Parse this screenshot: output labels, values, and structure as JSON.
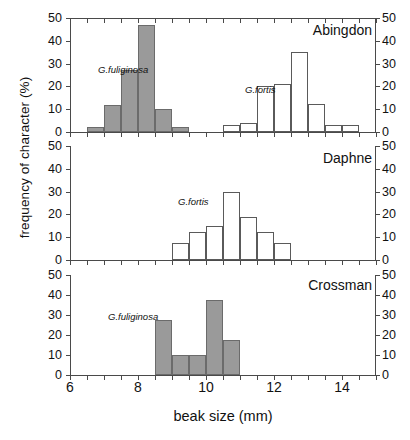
{
  "chart_data": {
    "type": "bar",
    "title": "",
    "xlabel": "beak size (mm)",
    "ylabel": "frequency of character (%)",
    "xlim": [
      6,
      15
    ],
    "ylim": [
      0,
      50
    ],
    "x_ticks_major": [
      6,
      8,
      10,
      12,
      14
    ],
    "x_tick_minor_step": 0.5,
    "y_ticks": [
      0,
      10,
      20,
      30,
      40,
      50
    ],
    "bin_width": 0.5,
    "grid": false,
    "legend": "inline-annotations",
    "panels": [
      {
        "name": "Abingdon",
        "label": "Abingdon",
        "series": [
          {
            "name": "G.fuliginosa",
            "annotation": "G.fuliginosa",
            "fill": "gray",
            "bins": [
              6.5,
              7.0,
              7.5,
              8.0,
              8.5,
              9.0
            ],
            "values": [
              2,
              12,
              27,
              47,
              10,
              2
            ]
          },
          {
            "name": "G.fortis",
            "annotation": "G.fortis",
            "fill": "white",
            "bins": [
              10.5,
              11.0,
              11.5,
              12.0,
              12.5,
              13.0,
              13.5,
              14.0
            ],
            "values": [
              3,
              4,
              20,
              21,
              35,
              12.5,
              3,
              3
            ]
          }
        ]
      },
      {
        "name": "Daphne",
        "label": "Daphne",
        "series": [
          {
            "name": "G.fortis",
            "annotation": "G.fortis",
            "fill": "white",
            "bins": [
              9.0,
              9.5,
              10.0,
              10.5,
              11.0,
              11.5,
              12.0
            ],
            "values": [
              7.5,
              12.5,
              15,
              30,
              19,
              12.5,
              7.5
            ]
          }
        ]
      },
      {
        "name": "Crossman",
        "label": "Crossman",
        "series": [
          {
            "name": "G.fuliginosa",
            "annotation": "G.fuliginosa",
            "fill": "gray",
            "bins": [
              8.5,
              9.0,
              9.5,
              10.0,
              10.5
            ],
            "values": [
              27.5,
              10,
              10,
              37.5,
              17.5
            ]
          }
        ]
      }
    ]
  },
  "axes": {
    "y_tick_labels": [
      "50",
      "40",
      "30",
      "20",
      "10",
      "0"
    ],
    "x_tick_labels": [
      "6",
      "8",
      "10",
      "12",
      "14"
    ],
    "y_title": "frequency of character (%)",
    "x_title": "beak size (mm)"
  },
  "colors": {
    "bar_fill_gray": "#9a9a9a",
    "bar_fill_white": "#ffffff",
    "bar_stroke": "#5a5a5a",
    "axis": "#4a4a4a",
    "text": "#111111"
  },
  "annotations": {
    "abingdon_fuliginosa": "G.fuliginosa",
    "abingdon_fortis": "G.fortis",
    "daphne_fortis": "G.fortis",
    "crossman_fuliginosa": "G.fuliginosa"
  },
  "panel_titles": {
    "top": "Abingdon",
    "middle": "Daphne",
    "bottom": "Crossman"
  }
}
